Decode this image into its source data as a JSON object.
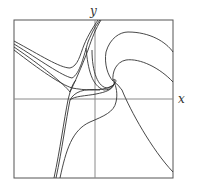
{
  "diagram": {
    "type": "phase-portrait",
    "axes": {
      "x_label": "x",
      "y_label": "y"
    },
    "frame": {
      "left": 14,
      "top": 20,
      "right": 173,
      "bottom": 178
    },
    "origin": {
      "x": 95,
      "y": 99
    },
    "colors": {
      "line": "#333333",
      "axis": "#8a8a8a",
      "frame": "#555555"
    }
  }
}
